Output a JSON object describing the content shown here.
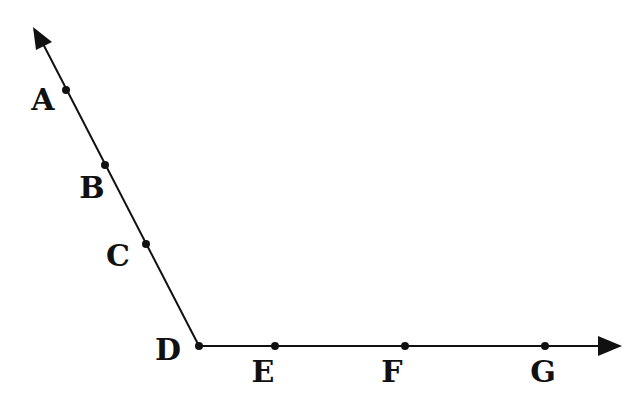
{
  "diagram": {
    "type": "angle-with-two-rays",
    "vertex": "D",
    "rays": [
      {
        "name": "ray-upper-left",
        "points": [
          "D",
          "C",
          "B",
          "A"
        ]
      },
      {
        "name": "ray-right",
        "points": [
          "D",
          "E",
          "F",
          "G"
        ]
      }
    ],
    "points": [
      {
        "id": "A",
        "label": "A",
        "x": 66,
        "y": 90,
        "lx": 43,
        "ly": 110
      },
      {
        "id": "B",
        "label": "B",
        "x": 105,
        "y": 165,
        "lx": 92,
        "ly": 198
      },
      {
        "id": "C",
        "label": "C",
        "x": 146,
        "y": 244,
        "lx": 118,
        "ly": 266
      },
      {
        "id": "D",
        "label": "D",
        "x": 199,
        "y": 346,
        "lx": 168,
        "ly": 360
      },
      {
        "id": "E",
        "label": "E",
        "x": 275,
        "y": 346,
        "lx": 263,
        "ly": 382
      },
      {
        "id": "F",
        "label": "F",
        "x": 405,
        "y": 346,
        "lx": 392,
        "ly": 382
      },
      {
        "id": "G",
        "label": "G",
        "x": 545,
        "y": 346,
        "lx": 543,
        "ly": 382
      }
    ],
    "colors": {
      "line": "#111111",
      "background": "#ffffff"
    }
  }
}
